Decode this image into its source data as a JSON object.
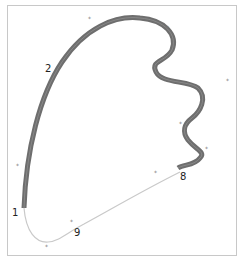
{
  "figure": {
    "title_fragment": "...g ... g ... p ...",
    "curve_labels": [
      {
        "id": "label-1",
        "text": "1",
        "x": 12,
        "y": 216
      },
      {
        "id": "label-2",
        "text": "2",
        "x": 45,
        "y": 72
      },
      {
        "id": "label-8",
        "text": "8",
        "x": 180,
        "y": 180
      },
      {
        "id": "label-9",
        "text": "9",
        "x": 74,
        "y": 236
      }
    ],
    "control_points": [
      {
        "x": 90,
        "y": 19
      },
      {
        "x": 18,
        "y": 166
      },
      {
        "x": 47,
        "y": 247
      },
      {
        "x": 228,
        "y": 81
      },
      {
        "x": 181,
        "y": 124
      },
      {
        "x": 207,
        "y": 149
      },
      {
        "x": 209,
        "y": 152
      },
      {
        "x": 155,
        "y": 67
      },
      {
        "x": 168,
        "y": 28
      },
      {
        "x": 72,
        "y": 222
      },
      {
        "x": 156,
        "y": 173
      }
    ],
    "colors": {
      "thick_stroke": "#6e6e6e",
      "thin_stroke": "#c9c9c9",
      "frame": "#c8c8c8"
    }
  }
}
